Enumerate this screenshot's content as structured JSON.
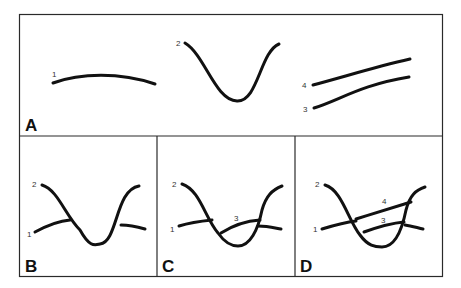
{
  "figure": {
    "panels": [
      {
        "letter": "A",
        "labels": {
          "l1": "1",
          "l2": "2",
          "l3": "3",
          "l4": "4"
        }
      },
      {
        "letter": "B",
        "labels": {
          "l1": "1",
          "l2": "2"
        }
      },
      {
        "letter": "C",
        "labels": {
          "l1": "1",
          "l2": "2",
          "l3": "3"
        }
      },
      {
        "letter": "D",
        "labels": {
          "l1": "1",
          "l2": "2",
          "l3": "3",
          "l4": "4"
        }
      }
    ]
  }
}
